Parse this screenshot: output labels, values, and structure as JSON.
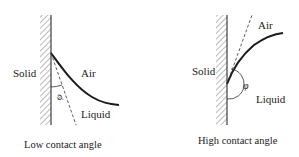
{
  "figure": {
    "panels": [
      {
        "id": "low",
        "labels": {
          "solid": "Solid",
          "air": "Air",
          "liquid": "Liquid",
          "angle": "φ"
        },
        "caption": "Low contact angle"
      },
      {
        "id": "high",
        "labels": {
          "solid": "Solid",
          "air": "Air",
          "liquid": "Liquid",
          "angle": "φ"
        },
        "caption": "High contact angle"
      }
    ],
    "colors": {
      "line": "#1a1a1a",
      "hatch": "#444444",
      "text": "#222222",
      "background": "#ffffff"
    }
  }
}
